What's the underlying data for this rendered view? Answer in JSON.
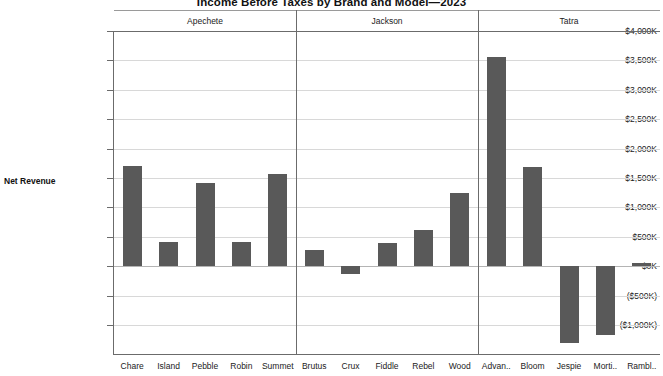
{
  "chart_data": {
    "type": "bar",
    "title": "Income Before Taxes by Brand and Model—2023",
    "xlabel": "",
    "ylabel": "Net Revenue",
    "ylim": [
      -1250,
      4000
    ],
    "ytick_labels": [
      "$4,000K",
      "$3,500K",
      "$3,000K",
      "$2,500K",
      "$2,000K",
      "$1,500K",
      "$1,000K",
      "$500K",
      "$0K",
      "($500K)",
      "($1,000K)"
    ],
    "ytick_values": [
      4000,
      3500,
      3000,
      2500,
      2000,
      1500,
      1000,
      500,
      0,
      -500,
      -1000
    ],
    "grid": true,
    "legend": "none",
    "bar_color": "#595959",
    "units": "thousands of dollars",
    "groups": [
      {
        "name": "Apechete",
        "categories": [
          "Chare",
          "Island",
          "Pebble",
          "Robin",
          "Summet"
        ],
        "values": [
          1706,
          404,
          1414,
          404,
          1564
        ]
      },
      {
        "name": "Jackson",
        "categories": [
          "Brutus",
          "Crux",
          "Fiddle",
          "Rebel",
          "Wood"
        ],
        "values": [
          284,
          -130,
          403,
          612,
          1247
        ]
      },
      {
        "name": "Tatra",
        "categories": [
          "Advan..",
          "Bloom",
          "Jespie",
          "Morti..",
          "Rambl.."
        ],
        "values": [
          3560,
          1690,
          -1305,
          -1165,
          60
        ]
      }
    ]
  }
}
